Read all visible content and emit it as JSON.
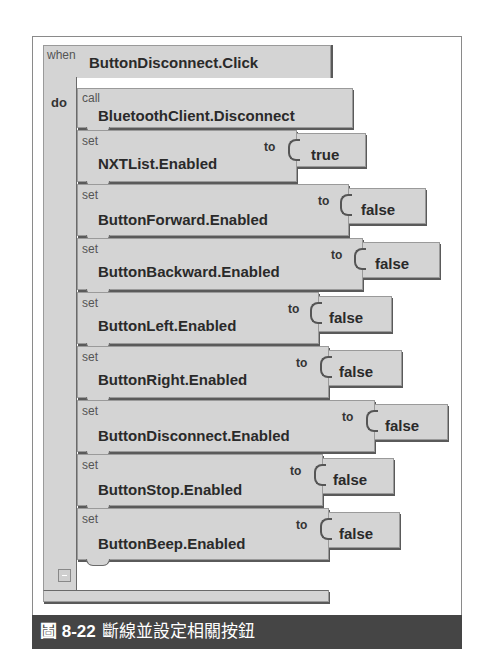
{
  "event": {
    "when_label": "when",
    "event_name": "ButtonDisconnect.Click",
    "do_label": "do"
  },
  "call_block": {
    "call_label": "call",
    "method": "BluetoothClient.Disconnect"
  },
  "set_blocks": [
    {
      "set_label": "set",
      "property": "NXTList.Enabled",
      "to_label": "to",
      "value": "true"
    },
    {
      "set_label": "set",
      "property": "ButtonForward.Enabled",
      "to_label": "to",
      "value": "false"
    },
    {
      "set_label": "set",
      "property": "ButtonBackward.Enabled",
      "to_label": "to",
      "value": "false"
    },
    {
      "set_label": "set",
      "property": "ButtonLeft.Enabled",
      "to_label": "to",
      "value": "false"
    },
    {
      "set_label": "set",
      "property": "ButtonRight.Enabled",
      "to_label": "to",
      "value": "false"
    },
    {
      "set_label": "set",
      "property": "ButtonDisconnect.Enabled",
      "to_label": "to",
      "value": "false"
    },
    {
      "set_label": "set",
      "property": "ButtonStop.Enabled",
      "to_label": "to",
      "value": "false"
    },
    {
      "set_label": "set",
      "property": "ButtonBeep.Enabled",
      "to_label": "to",
      "value": "false"
    }
  ],
  "collapse_button": "-",
  "caption": {
    "figure_number": "圖 8-22",
    "text": "斷線並設定相關按鈕"
  },
  "colors": {
    "block_fill": "#d4d4d4",
    "block_shadow": "#5a5a5a",
    "caption_bg": "#454545",
    "caption_text": "#ffffff"
  }
}
